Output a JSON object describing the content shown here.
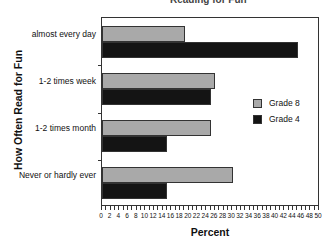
{
  "chart_data": {
    "type": "bar",
    "orientation": "horizontal",
    "title": "Reading for Fun",
    "xlabel": "Percent",
    "ylabel": "How Often Read for Fun",
    "categories": [
      "almost every day",
      "1-2 times week",
      "1-2 times month",
      "Never or hardly ever"
    ],
    "series": [
      {
        "name": "Grade 8",
        "color": "#a9a9a9",
        "values": [
          19,
          26,
          25,
          30
        ]
      },
      {
        "name": "Grade 4",
        "color": "#141414",
        "values": [
          45,
          25,
          15,
          15
        ]
      }
    ],
    "xlim": [
      0,
      50
    ],
    "xticks": [
      0,
      2,
      4,
      6,
      8,
      10,
      12,
      14,
      16,
      18,
      20,
      22,
      24,
      26,
      28,
      30,
      32,
      34,
      36,
      38,
      40,
      42,
      44,
      46,
      48,
      50
    ],
    "grid": false,
    "legend_position": "right-center inside plot"
  }
}
